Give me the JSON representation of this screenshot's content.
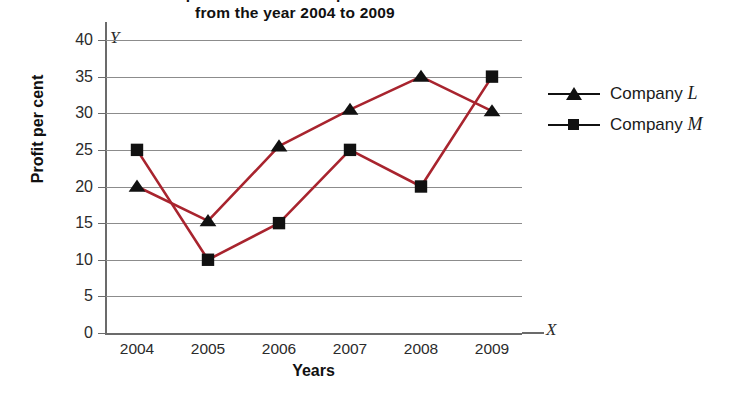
{
  "chart_data": {
    "type": "line",
    "title": "Profit per cent of two companies L and M\nfrom the year 2004 to 2009",
    "title_line_1": "Profit per cent of two companies L and M",
    "title_line_2": "from the year 2004 to 2009",
    "xlabel": "Years",
    "ylabel": "Profit per cent",
    "x_axis_symbol": "X",
    "y_axis_symbol": "Y",
    "categories": [
      "2004",
      "2005",
      "2006",
      "2007",
      "2008",
      "2009"
    ],
    "x_tick_labels": [
      "2004",
      "2005",
      "2006",
      "2007",
      "2008",
      "2009"
    ],
    "y_tick_labels": [
      "0",
      "5",
      "10",
      "15",
      "20",
      "25",
      "30",
      "35",
      "40"
    ],
    "ylim": [
      0,
      40
    ],
    "y_tick_step": 5,
    "grid": true,
    "grid_axis": "y",
    "legend_position": "right",
    "line_color": "#a8242e",
    "marker_color": "#111111",
    "grid_color": "#8c8c8c",
    "series": [
      {
        "name": "Company L",
        "name_base": "Company",
        "name_italic": "L",
        "marker": "triangle",
        "values": [
          20,
          15.3,
          25.5,
          30.5,
          35,
          30.3
        ]
      },
      {
        "name": "Company M",
        "name_base": "Company",
        "name_italic": "M",
        "marker": "square",
        "values": [
          25,
          10,
          15,
          25,
          20,
          35
        ]
      }
    ]
  },
  "legend": {
    "items": [
      {
        "label_base": "Company",
        "label_italic": "L"
      },
      {
        "label_base": "Company",
        "label_italic": "M"
      }
    ]
  }
}
